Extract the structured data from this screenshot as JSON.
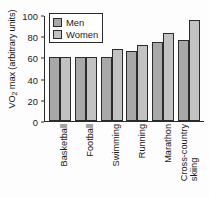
{
  "chart_data": {
    "type": "bar",
    "title": "",
    "xlabel": "",
    "ylabel": "VO2 max (arbitrary units)",
    "ylabel_prefix": "VO",
    "ylabel_sub": "2",
    "ylabel_suffix": " max (arbitrary units)",
    "categories": [
      "Basketball",
      "Football",
      "Swimming",
      "Running",
      "Marathon",
      "Cross-country skiing"
    ],
    "categories_lines": [
      [
        "Basketball"
      ],
      [
        "Football"
      ],
      [
        "Swimming"
      ],
      [
        "Running"
      ],
      [
        "Marathon"
      ],
      [
        "Cross-country",
        "skiing"
      ]
    ],
    "series": [
      {
        "name": "Men",
        "values": [
          60,
          60,
          60,
          66,
          75,
          76
        ],
        "color": "#a8a8a8"
      },
      {
        "name": "Women",
        "values": [
          60,
          60,
          68,
          72,
          83,
          95
        ],
        "color": "#c2c2c2"
      }
    ],
    "ylim": [
      0,
      100
    ],
    "yticks": [
      0,
      20,
      40,
      60,
      80,
      100
    ],
    "ytick_labels": [
      "0",
      "20",
      "40",
      "60",
      "80",
      "100"
    ],
    "grid": false,
    "legend_position": "top-left"
  },
  "legend": {
    "entries": [
      {
        "label": "Men",
        "color": "#a8a8a8"
      },
      {
        "label": "Women",
        "color": "#c2c2c2"
      }
    ]
  },
  "colors": {
    "men": "#a8a8a8",
    "women": "#c2c2c2",
    "axis": "#2b2b2b",
    "text": "#1a1a1a",
    "background": "#fdfdfd"
  }
}
